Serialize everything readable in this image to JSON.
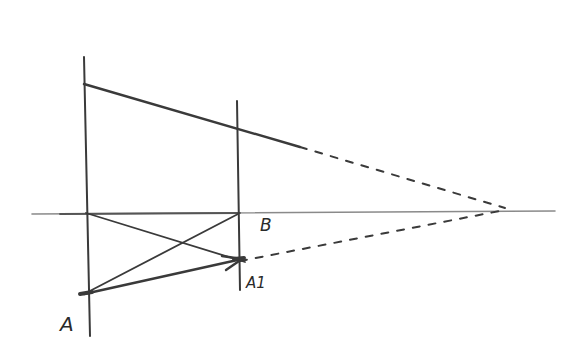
{
  "diagram": {
    "type": "hand-drawn pencil sketch",
    "colors": {
      "stroke": "#3a3a3a",
      "faint": "#8a8a8a",
      "background": "#ffffff"
    },
    "labels": {
      "A": "A",
      "A1": "A1",
      "B": "B"
    },
    "elements": [
      "horizontal axis line",
      "left vertical line",
      "right vertical line",
      "top converging line to vanishing point",
      "bottom dashed converging line to vanishing point",
      "diagonal from axis/left-line intersection to A1",
      "diagonal from A to B",
      "arrow from A to A1"
    ]
  }
}
